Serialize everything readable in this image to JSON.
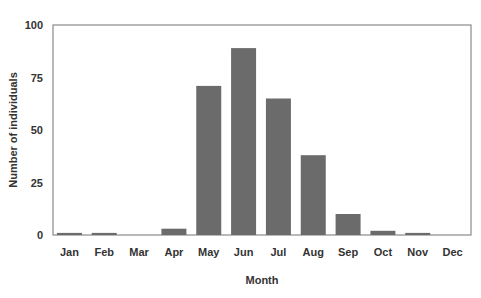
{
  "chart_data": {
    "type": "bar",
    "title": "",
    "xlabel": "Month",
    "ylabel": "Number of individuals",
    "categories": [
      "Jan",
      "Feb",
      "Mar",
      "Apr",
      "May",
      "Jun",
      "Jul",
      "Aug",
      "Sep",
      "Oct",
      "Nov",
      "Dec"
    ],
    "values": [
      1,
      1,
      0,
      3,
      71,
      89,
      65,
      38,
      10,
      2,
      1,
      0
    ],
    "ylim": [
      0,
      100
    ],
    "yticks": [
      0,
      25,
      50,
      75,
      100
    ],
    "grid": false,
    "legend": null,
    "bar_color": "#6b6b6b",
    "axis_color": "#8a8a8a"
  }
}
